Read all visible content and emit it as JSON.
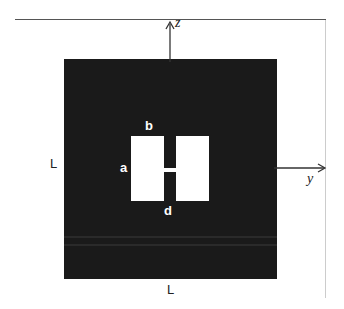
{
  "diagram": {
    "axes": {
      "z_label": "z",
      "y_label": "y"
    },
    "labels": {
      "side_left": "L",
      "side_bottom": "L",
      "patch_height": "a",
      "patch_width": "b",
      "gap": "g",
      "feed_width": "d"
    },
    "colors": {
      "substrate": "#1a1a1a",
      "patch": "#ffffff",
      "axis": "#333333"
    }
  }
}
